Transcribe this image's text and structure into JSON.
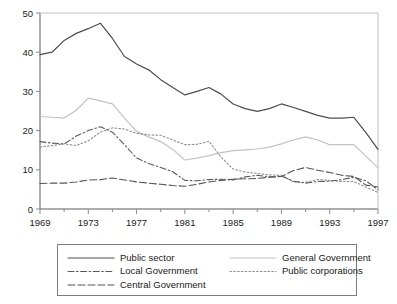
{
  "chart_data": {
    "type": "line",
    "title": "",
    "subtitle": "",
    "xlabel": "",
    "ylabel": "",
    "xlim": [
      1969,
      1997
    ],
    "ylim": [
      0,
      50
    ],
    "yticks": [
      0,
      10,
      20,
      30,
      40,
      50
    ],
    "xticks": [
      1969,
      1973,
      1977,
      1981,
      1985,
      1989,
      1993,
      1997
    ],
    "grid": false,
    "legend_position": "below",
    "x": [
      1969,
      1970,
      1971,
      1972,
      1973,
      1974,
      1975,
      1976,
      1977,
      1978,
      1979,
      1980,
      1981,
      1982,
      1983,
      1984,
      1985,
      1986,
      1987,
      1988,
      1989,
      1990,
      1991,
      1992,
      1993,
      1994,
      1995,
      1996,
      1997
    ],
    "series": [
      {
        "name": "Public sector",
        "style": "solid",
        "color": "#4d4d4d",
        "values": [
          39.4,
          40.0,
          43.0,
          44.8,
          46.0,
          47.4,
          43.5,
          38.9,
          37.0,
          35.5,
          33.0,
          31.0,
          29.1,
          30.0,
          31.0,
          29.3,
          26.8,
          25.6,
          24.9,
          25.6,
          26.8,
          25.9,
          24.9,
          23.9,
          23.2,
          23.2,
          23.4,
          19.5,
          15.2
        ]
      },
      {
        "name": "General Government",
        "style": "solid",
        "color": "#c2c2c2",
        "values": [
          23.6,
          23.4,
          23.2,
          25.2,
          28.3,
          27.6,
          26.8,
          23.2,
          19.8,
          18.4,
          17.2,
          15.2,
          12.5,
          13.0,
          13.6,
          14.4,
          14.9,
          15.1,
          15.3,
          15.8,
          16.6,
          17.6,
          18.4,
          17.6,
          16.4,
          16.4,
          16.4,
          13.5,
          10.5
        ]
      },
      {
        "name": "Local Government",
        "style": "dashdot",
        "color": "#5a5a5a",
        "values": [
          17.2,
          16.8,
          16.6,
          18.6,
          20.0,
          21.0,
          19.6,
          16.4,
          13.0,
          11.6,
          10.6,
          9.5,
          7.3,
          7.2,
          7.5,
          7.6,
          7.4,
          8.2,
          8.6,
          8.2,
          8.4,
          7.1,
          6.6,
          7.0,
          7.1,
          7.5,
          8.1,
          7.2,
          4.9
        ]
      },
      {
        "name": "Public corporations",
        "style": "dotted",
        "color": "#8f8f8f",
        "values": [
          15.8,
          16.2,
          16.6,
          16.2,
          17.4,
          19.6,
          20.7,
          20.4,
          19.3,
          18.9,
          18.8,
          17.6,
          16.4,
          16.5,
          17.3,
          13.2,
          10.2,
          9.4,
          9.1,
          8.7,
          8.6,
          6.9,
          6.8,
          7.5,
          7.3,
          7.0,
          7.0,
          5.6,
          4.2
        ]
      },
      {
        "name": "Central Government",
        "style": "dashed",
        "color": "#555555",
        "values": [
          6.5,
          6.6,
          6.6,
          6.9,
          7.4,
          7.5,
          7.9,
          7.4,
          6.9,
          6.6,
          6.3,
          6.0,
          5.8,
          6.3,
          6.9,
          7.3,
          7.6,
          7.7,
          7.8,
          8.1,
          8.3,
          9.8,
          10.6,
          9.9,
          9.3,
          8.6,
          8.3,
          6.1,
          5.6
        ]
      }
    ]
  },
  "axes": {
    "ytick_labels": [
      "50",
      "40",
      "30",
      "20",
      "10",
      "0"
    ],
    "xtick_labels": [
      "1969",
      "1973",
      "1977",
      "1981",
      "1985",
      "1989",
      "1993",
      "1997"
    ]
  },
  "legend": {
    "entries": [
      {
        "label": "Public sector",
        "style": "solid",
        "color": "#4d4d4d",
        "col": 0,
        "row": 0
      },
      {
        "label": "General Government",
        "style": "solid",
        "color": "#c2c2c2",
        "col": 1,
        "row": 0
      },
      {
        "label": "Local Government",
        "style": "dashdot",
        "color": "#5a5a5a",
        "col": 0,
        "row": 1
      },
      {
        "label": "Public corporations",
        "style": "dotted",
        "color": "#8f8f8f",
        "col": 1,
        "row": 1
      },
      {
        "label": "Central Government",
        "style": "dashed",
        "color": "#555555",
        "col": 0,
        "row": 2
      }
    ]
  }
}
